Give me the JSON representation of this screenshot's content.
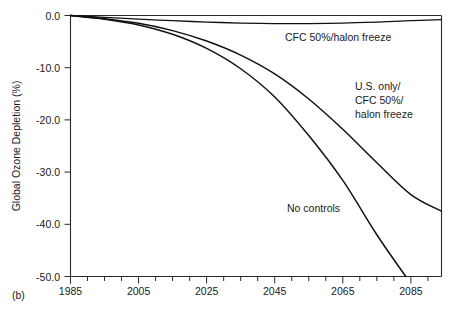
{
  "figure": {
    "panel_label": "(b)",
    "background": "#ffffff",
    "line_color": "#111111"
  },
  "chart_data": {
    "type": "line",
    "title": "",
    "subtitle": "",
    "xlabel": "",
    "ylabel": "Global Ozone Depletion (%)",
    "xlim": [
      1985,
      2094
    ],
    "ylim": [
      -50.0,
      0.0
    ],
    "grid": false,
    "legend_position": "inline-annotations",
    "x_tick_labels": [
      "1985",
      "2005",
      "2025",
      "2045",
      "2065",
      "2085"
    ],
    "x_ticks": [
      1985,
      2005,
      2025,
      2045,
      2065,
      2085
    ],
    "x_minor_tick_interval": 5,
    "y_tick_labels": [
      "0.0",
      "-10.0",
      "-20.0",
      "-30.0",
      "-40.0",
      "-50.0"
    ],
    "y_ticks": [
      0.0,
      -10.0,
      -20.0,
      -30.0,
      -40.0,
      -50.0
    ],
    "series": [
      {
        "name": "CFC 50%/halon freeze",
        "label_lines": [
          "CFC 50%/halon freeze"
        ],
        "label_x": 2050,
        "label_y": -3.3,
        "x": [
          1985,
          1995,
          2005,
          2015,
          2025,
          2035,
          2045,
          2055,
          2065,
          2075,
          2085,
          2094
        ],
        "values": [
          0.0,
          -0.35,
          -0.7,
          -1.0,
          -1.25,
          -1.45,
          -1.55,
          -1.55,
          -1.45,
          -1.25,
          -1.0,
          -0.8
        ]
      },
      {
        "name": "U.S. only/CFC 50%/halon freeze",
        "label_lines": [
          "U.S. only/",
          "CFC 50%/",
          "halon freeze"
        ],
        "label_x": 2066,
        "label_y": -13.0,
        "x": [
          1985,
          1995,
          2005,
          2015,
          2025,
          2035,
          2045,
          2055,
          2065,
          2075,
          2085,
          2094
        ],
        "values": [
          0.0,
          -0.6,
          -1.5,
          -2.9,
          -4.9,
          -7.6,
          -11.2,
          -16.0,
          -21.8,
          -28.2,
          -34.3,
          -37.5
        ]
      },
      {
        "name": "No controls",
        "label_lines": [
          "No controls"
        ],
        "label_x": 2047,
        "label_y": -36.5,
        "x": [
          1985,
          1995,
          2005,
          2015,
          2025,
          2035,
          2045,
          2055,
          2065,
          2075,
          2083.5
        ],
        "values": [
          0.0,
          -0.7,
          -1.8,
          -3.6,
          -6.3,
          -10.2,
          -15.6,
          -23.0,
          -31.6,
          -42.0,
          -50.0
        ]
      }
    ]
  }
}
